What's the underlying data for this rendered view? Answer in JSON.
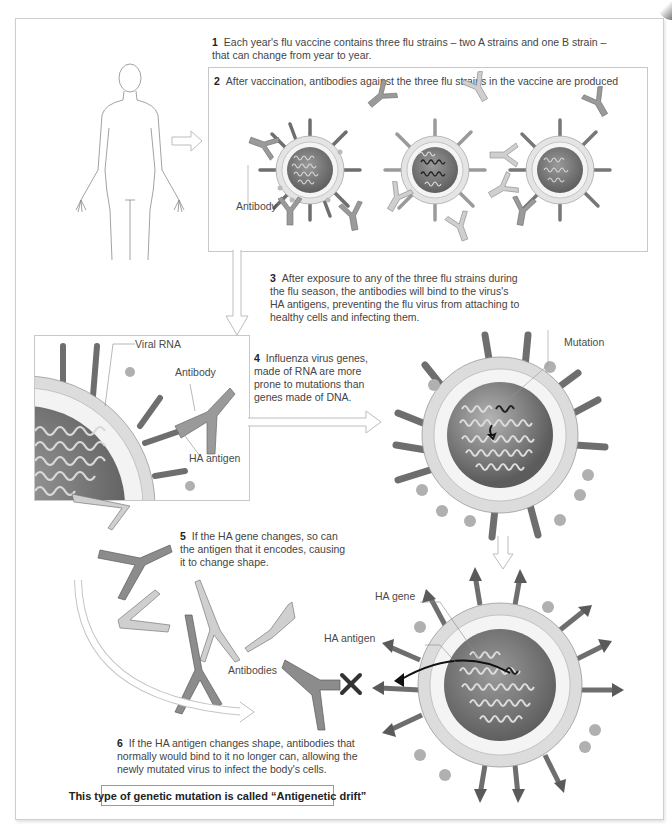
{
  "diagram": {
    "steps": [
      {
        "num": "1",
        "text": "Each year's flu vaccine contains three flu strains – two A strains and one B strain – that can change from year to year."
      },
      {
        "num": "2",
        "text": "After vaccination, antibodies against the three flu strains in the vaccine are produced"
      },
      {
        "num": "3",
        "text": "After exposure to any of the three flu strains during the flu season, the antibodies will bind to the virus's HA antigens, preventing the flu virus from attaching to healthy cells and infecting them."
      },
      {
        "num": "4",
        "text": "Influenza virus genes, made of RNA are more prone to mutations than genes made of DNA."
      },
      {
        "num": "5",
        "text": "If the HA gene changes, so can the antigen that it encodes, causing it to change shape."
      },
      {
        "num": "6",
        "text": "If the HA antigen changes shape, antibodies that normally would bind to it no longer can, allowing the newly mutated virus to infect the body's cells."
      }
    ],
    "labels": {
      "antibody_step2": "Antibody",
      "viral_rna": "Viral RNA",
      "antibody_detail": "Antibody",
      "ha_antigen_detail": "HA antigen",
      "mutation": "Mutation",
      "ha_gene": "HA gene",
      "ha_antigen_mutated": "HA antigen",
      "antibodies": "Antibodies"
    },
    "conclusion": "This type of genetic mutation is called “Antigenetic drift”",
    "colors": {
      "virus_core": "#6e6e6e",
      "virus_envelope": "#d9d9d9",
      "spike_dark": "#707070",
      "spike_light": "#a8a8a8",
      "antibody_dark": "#8c8c8c",
      "antibody_light": "#c8c8c8",
      "outline": "#c4c4c4"
    }
  }
}
